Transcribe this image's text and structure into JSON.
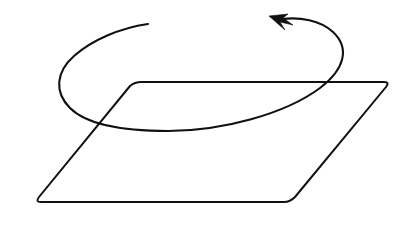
{
  "figure": {
    "background_color": "#ffffff",
    "stroke_color": "#111111",
    "canvas": {
      "width": 408,
      "height": 236
    },
    "elements": {
      "plane": {
        "name": "parallelogram-plane",
        "description": "Parallelogram drawn in perspective representing a flat plane",
        "stroke_width": 2,
        "corner_radius": 6,
        "vertices": [
          {
            "label": "top-left",
            "x": 135,
            "y": 82
          },
          {
            "label": "top-right",
            "x": 390,
            "y": 82
          },
          {
            "label": "bottom-right",
            "x": 290,
            "y": 201
          },
          {
            "label": "bottom-left",
            "x": 35,
            "y": 202
          }
        ],
        "path": "M 141 82 L 384 82 Q 390 82 386 87 L 295 197 Q 290 202 284 202 L 41 202 Q 35 202 39 197 L 130 86 Q 135 82 141 82 Z"
      },
      "rotation_arc": {
        "name": "rotation-arc",
        "description": "Open elliptical arc encircling the plane, indicating counter-clockwise rotation",
        "stroke_width": 2.1,
        "ellipse_center": {
          "x": 203,
          "y": 72
        },
        "radius_x": 145,
        "radius_y": 58,
        "tail_point": {
          "x": 148,
          "y": 24
        },
        "head_point": {
          "x": 276,
          "y": 22
        },
        "direction": "counter-clockwise",
        "path": "M 148 24 C 120 28 92 40 74 56 C 56 72 54 92 70 108 C 88 126 126 131 168 131 C 222 131 285 114 320 88 C 345 69 350 48 333 32 C 320 20 300 17 282 19"
      },
      "arrow_head": {
        "name": "arrow-head",
        "description": "Solid triangular arrowhead at the end of the rotation arc pointing up-left",
        "tip": {
          "x": 269,
          "y": 16
        },
        "path": "M 269 16 L 285 30 L 280 22 L 293 25 L 283 18 L 288 14 Z"
      }
    }
  }
}
